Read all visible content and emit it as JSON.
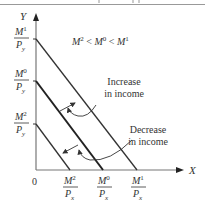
{
  "diagram": {
    "axes": {
      "y_label": "Y",
      "x_label": "X",
      "origin_label": "0"
    },
    "inequality": {
      "parts": [
        "M",
        "2",
        " < ",
        "M",
        "0",
        " < ",
        "M",
        "1"
      ]
    },
    "y_intercepts": [
      {
        "num": "M",
        "sup": "1",
        "den": "P",
        "sub": "y"
      },
      {
        "num": "M",
        "sup": "0",
        "den": "P",
        "sub": "y"
      },
      {
        "num": "M",
        "sup": "2",
        "den": "P",
        "sub": "y"
      }
    ],
    "x_intercepts": [
      {
        "num": "M",
        "sup": "2",
        "den": "P",
        "sub": "x"
      },
      {
        "num": "M",
        "sup": "0",
        "den": "P",
        "sub": "x"
      },
      {
        "num": "M",
        "sup": "1",
        "den": "P",
        "sub": "x"
      }
    ],
    "annotations": {
      "increase": [
        "Increase",
        "in income"
      ],
      "decrease": [
        "Decrease",
        "in income"
      ]
    },
    "colors": {
      "line": "#333333",
      "axis": "#666666",
      "text": "#333333"
    }
  }
}
